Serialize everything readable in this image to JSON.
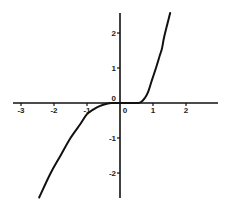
{
  "chart_data": {
    "type": "line",
    "title": "",
    "xlabel": "",
    "ylabel": "",
    "xlim": [
      -3.2,
      2.95
    ],
    "ylim": [
      -2.7,
      2.57
    ],
    "grid": false,
    "legend": null,
    "x_ticks": [
      -3,
      -2,
      -1,
      0,
      1,
      2
    ],
    "x_tick_labels": [
      "-3",
      "-2",
      "-1",
      "0",
      "1",
      "2"
    ],
    "y_ticks": [
      2,
      1,
      0,
      -1,
      -2
    ],
    "y_tick_labels": [
      "2",
      "1",
      "0",
      "-1",
      "-2"
    ],
    "series": [
      {
        "name": "f(x)",
        "color": "#111111",
        "x": [
          -2.45,
          -2.1,
          -1.8,
          -1.5,
          -1.2,
          -1.0,
          -0.8,
          -0.6,
          -0.4,
          -0.25,
          0.0,
          0.2,
          0.4,
          0.55,
          0.64,
          0.75,
          0.85,
          0.97,
          1.09,
          1.21,
          1.27,
          1.33,
          1.42,
          1.52
        ],
        "y": [
          -2.7,
          -2.0,
          -1.5,
          -1.0,
          -0.6,
          -0.32,
          -0.18,
          -0.08,
          -0.02,
          0.0,
          0.0,
          0.0,
          0.0,
          0.0,
          0.03,
          0.14,
          0.31,
          0.66,
          1.0,
          1.37,
          1.55,
          1.85,
          2.2,
          2.57
        ]
      }
    ]
  },
  "axes": {
    "origin_px": [
      120,
      103
    ],
    "x_unit_px": 33,
    "y_unit_px": 35,
    "x_axis_px_range": [
      13,
      218
    ],
    "y_axis_px_range": [
      13,
      198
    ]
  }
}
